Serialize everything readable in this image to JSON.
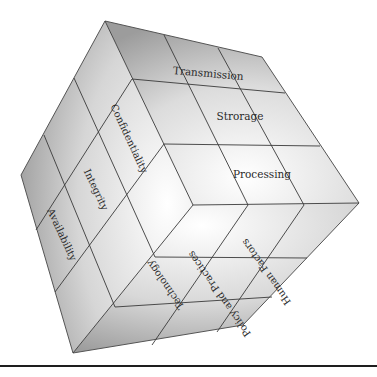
{
  "diagram": {
    "type": "cube",
    "name": "security cube",
    "faces": {
      "top": {
        "axis": "information states",
        "rows": [
          "Transmission",
          "Strorage",
          "Processing"
        ]
      },
      "left": {
        "axis": "security goals",
        "columns": [
          "Confidentiality",
          "Integrity",
          "Availability"
        ]
      },
      "bottom": {
        "axis": "countermeasures",
        "columns": [
          "Technology",
          "Policy and Practices",
          "Human Factors"
        ]
      }
    },
    "colors": {
      "face_light": "#fafafa",
      "face_dark": "#9a9a9a",
      "grid_line": "#3a3a3a",
      "rule": "#1e1e1e"
    }
  }
}
